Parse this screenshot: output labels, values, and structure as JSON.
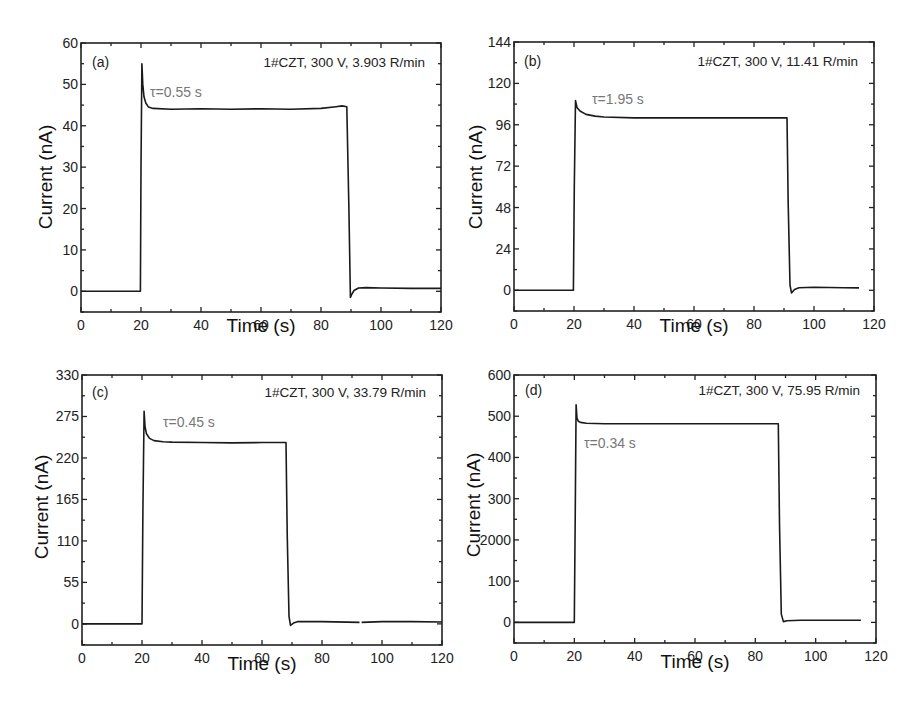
{
  "figure": {
    "panels": [
      {
        "id": "a",
        "letter": "(a)",
        "info": "1#CZT, 300 V, 3.903 R/min",
        "tau": "τ=0.55 s",
        "xlabel": "Time (s)",
        "ylabel": "Current (nA)"
      },
      {
        "id": "b",
        "letter": "(b)",
        "info": "1#CZT, 300 V, 11.41 R/min",
        "tau": "τ=1.95 s",
        "xlabel": "Time (s)",
        "ylabel": "Current (nA)"
      },
      {
        "id": "c",
        "letter": "(c)",
        "info": "1#CZT, 300 V, 33.79 R/min",
        "tau": "τ=0.45 s",
        "xlabel": "Time (s)",
        "ylabel": "Current (nA)"
      },
      {
        "id": "d",
        "letter": "(d)",
        "info": "1#CZT, 300 V, 75.95 R/min",
        "tau": "τ=0.34 s",
        "xlabel": "Time (s)",
        "ylabel": "Current (nA)",
        "ytick_artifact": "2000"
      }
    ]
  },
  "chart_data": [
    {
      "type": "line",
      "panel": "(a)",
      "title": "1#CZT, 300 V, 3.903 R/min",
      "annotation": "τ=0.55 s",
      "xlabel": "Time (s)",
      "ylabel": "Current (nA)",
      "xlim": [
        0,
        120
      ],
      "ylim": [
        -5,
        60
      ],
      "xticks": [
        0,
        20,
        40,
        60,
        80,
        100,
        120
      ],
      "yticks": [
        0,
        10,
        20,
        30,
        40,
        50,
        60
      ],
      "grid": false,
      "legend": "none",
      "series": [
        {
          "name": "photocurrent",
          "x": [
            0,
            19.8,
            20.0,
            20.3,
            20.6,
            21.0,
            21.6,
            22.5,
            24,
            30,
            40,
            50,
            60,
            70,
            80,
            85,
            87,
            88.6,
            89.3,
            89.8,
            90.2,
            91,
            92.5,
            95,
            100,
            110,
            120
          ],
          "y": [
            0,
            0,
            30,
            55,
            50,
            47,
            45.5,
            44.5,
            44.2,
            44,
            44.1,
            44,
            44.1,
            44,
            44.2,
            44.6,
            44.8,
            44.6,
            20,
            -1.5,
            -0.8,
            0.2,
            0.8,
            0.9,
            0.8,
            0.7,
            0.7
          ]
        }
      ]
    },
    {
      "type": "line",
      "panel": "(b)",
      "title": "1#CZT, 300 V, 11.41 R/min",
      "annotation": "τ=1.95 s",
      "xlabel": "Time (s)",
      "ylabel": "Current (nA)",
      "xlim": [
        0,
        120
      ],
      "ylim": [
        -12,
        144
      ],
      "xticks": [
        0,
        20,
        40,
        60,
        80,
        100,
        120
      ],
      "yticks": [
        0,
        24,
        48,
        72,
        96,
        120,
        144
      ],
      "grid": false,
      "legend": "none",
      "series": [
        {
          "name": "photocurrent",
          "x": [
            0,
            19.8,
            20.1,
            20.5,
            21.0,
            22,
            24,
            27,
            30,
            40,
            50,
            60,
            70,
            80,
            91,
            91.4,
            92.0,
            92.5,
            93.5,
            95,
            100,
            110,
            115
          ],
          "y": [
            0,
            0,
            60,
            110,
            106,
            104,
            102,
            101,
            100.5,
            100,
            100,
            100,
            100,
            100,
            100,
            50,
            3,
            -1.5,
            0.5,
            1.5,
            1.8,
            1.5,
            1.4
          ]
        }
      ]
    },
    {
      "type": "line",
      "panel": "(c)",
      "title": "1#CZT, 300 V, 33.79 R/min",
      "annotation": "τ=0.45 s",
      "xlabel": "Time (s)",
      "ylabel": "Current (nA)",
      "xlim": [
        0,
        120
      ],
      "ylim": [
        -28,
        330
      ],
      "xticks": [
        0,
        20,
        40,
        60,
        80,
        100,
        120
      ],
      "yticks": [
        0,
        55,
        110,
        165,
        220,
        275,
        330
      ],
      "grid": false,
      "legend": "none",
      "series": [
        {
          "name": "photocurrent",
          "x": [
            0,
            20.0,
            20.3,
            20.7,
            21.0,
            21.5,
            22.5,
            24,
            27,
            30,
            40,
            50,
            60,
            68.0,
            68.4,
            69.0,
            69.5,
            70.5,
            72,
            80,
            92.5,
            93,
            93.2,
            100,
            110,
            120
          ],
          "y": [
            0,
            0,
            150,
            282,
            262,
            252,
            246,
            243,
            241.5,
            241,
            240.5,
            240,
            240.5,
            240.5,
            120,
            10,
            -2,
            1,
            3,
            3,
            2,
            null,
            2,
            3,
            3,
            2.5
          ]
        }
      ]
    },
    {
      "type": "line",
      "panel": "(d)",
      "title": "1#CZT, 300 V, 75.95 R/min",
      "annotation": "τ=0.34 s",
      "xlabel": "Time (s)",
      "ylabel": "Current (nA)",
      "xlim": [
        0,
        120
      ],
      "ylim": [
        -50,
        600
      ],
      "xticks": [
        0,
        20,
        40,
        60,
        80,
        100,
        120
      ],
      "yticks": [
        0,
        100,
        200,
        300,
        400,
        500,
        600
      ],
      "ytick_labels_rendered": [
        "0",
        "100",
        "2000",
        "300",
        "400",
        "500",
        "600"
      ],
      "grid": false,
      "legend": "none",
      "series": [
        {
          "name": "photocurrent",
          "x": [
            0,
            20.0,
            20.3,
            20.6,
            20.9,
            21.3,
            22,
            24,
            30,
            40,
            50,
            60,
            70,
            80,
            87.6,
            88.0,
            88.6,
            89.3,
            90.5,
            95,
            100,
            110,
            115
          ],
          "y": [
            0,
            0,
            250,
            528,
            495,
            488,
            485,
            483,
            482,
            482,
            482,
            482,
            482,
            482,
            482,
            240,
            20,
            2,
            4,
            5,
            5,
            5,
            5
          ]
        }
      ]
    }
  ]
}
